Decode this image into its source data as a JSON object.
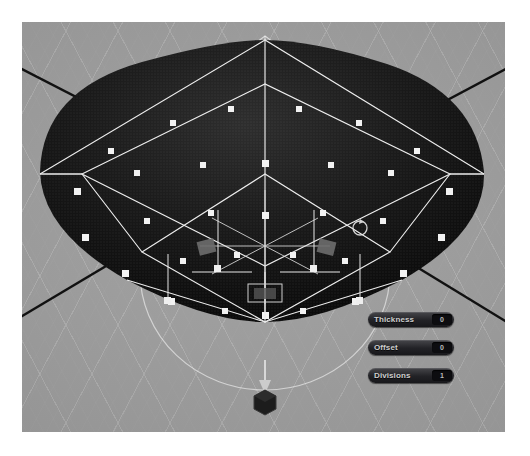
{
  "app": {
    "view_mode": "3D viewport",
    "background_color": "#9a9a9a",
    "mesh_color": "#141414",
    "wireframe_color": "#ffffff",
    "axis_color": "#111111",
    "grid_color": "#bebebe"
  },
  "parameters": [
    {
      "label": "Thickness",
      "value": "0"
    },
    {
      "label": "Offset",
      "value": "0"
    },
    {
      "label": "Divisions",
      "value": "1"
    }
  ],
  "icons": {
    "rotate": "rotate-cursor-icon",
    "origin": "origin-cube-gizmo",
    "arrow": "move-arrow-gizmo"
  }
}
